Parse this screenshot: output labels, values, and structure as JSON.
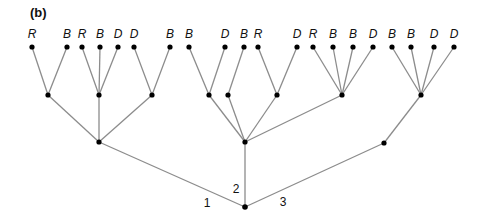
{
  "panel_label": "(b)",
  "root": {
    "id": "root",
    "x": 245,
    "y": 207
  },
  "branch_labels": [
    {
      "text": "1",
      "x": 207,
      "y": 207
    },
    {
      "text": "2",
      "x": 236,
      "y": 193
    },
    {
      "text": "3",
      "x": 283,
      "y": 206
    }
  ],
  "level1": [
    {
      "id": "n1",
      "x": 99,
      "y": 142
    },
    {
      "id": "n2",
      "x": 245,
      "y": 142
    },
    {
      "id": "n3",
      "x": 384,
      "y": 143
    }
  ],
  "level2": [
    {
      "id": "a1",
      "parent": "n1",
      "x": 48,
      "y": 95
    },
    {
      "id": "a2",
      "parent": "n1",
      "x": 99,
      "y": 95
    },
    {
      "id": "a3",
      "parent": "n1",
      "x": 152,
      "y": 95
    },
    {
      "id": "b1",
      "parent": "n2",
      "x": 209,
      "y": 95
    },
    {
      "id": "b2",
      "parent": "n2",
      "x": 228,
      "y": 95
    },
    {
      "id": "b3",
      "parent": "n2",
      "x": 277,
      "y": 95
    },
    {
      "id": "b4",
      "parent": "n2",
      "x": 342,
      "y": 95
    },
    {
      "id": "c1",
      "parent": "n3",
      "x": 421,
      "y": 95
    }
  ],
  "leaves": [
    {
      "parent": "a1",
      "label": "R",
      "x": 32,
      "y": 47
    },
    {
      "parent": "a1",
      "label": "B",
      "x": 67,
      "y": 47
    },
    {
      "parent": "a2",
      "label": "R",
      "x": 82,
      "y": 47
    },
    {
      "parent": "a2",
      "label": "B",
      "x": 100,
      "y": 47
    },
    {
      "parent": "a2",
      "label": "D",
      "x": 118,
      "y": 47
    },
    {
      "parent": "a3",
      "label": "D",
      "x": 134,
      "y": 47
    },
    {
      "parent": "a3",
      "label": "B",
      "x": 170,
      "y": 47
    },
    {
      "parent": "b1",
      "label": "B",
      "x": 189,
      "y": 47
    },
    {
      "parent": "b1",
      "label": "D",
      "x": 225,
      "y": 47
    },
    {
      "parent": "b2",
      "label": "B",
      "x": 244,
      "y": 47
    },
    {
      "parent": "b3",
      "label": "R",
      "x": 258,
      "y": 47
    },
    {
      "parent": "b3",
      "label": "D",
      "x": 297,
      "y": 47
    },
    {
      "parent": "b4",
      "label": "R",
      "x": 313,
      "y": 47
    },
    {
      "parent": "b4",
      "label": "B",
      "x": 333,
      "y": 47
    },
    {
      "parent": "b4",
      "label": "B",
      "x": 353,
      "y": 47
    },
    {
      "parent": "b4",
      "label": "D",
      "x": 373,
      "y": 47
    },
    {
      "parent": "c1",
      "label": "B",
      "x": 392,
      "y": 47
    },
    {
      "parent": "c1",
      "label": "B",
      "x": 411,
      "y": 47
    },
    {
      "parent": "c1",
      "label": "D",
      "x": 434,
      "y": 47
    },
    {
      "parent": "c1",
      "label": "D",
      "x": 454,
      "y": 47
    }
  ],
  "colors": {
    "edge": "#8c8c8c",
    "node": "#000000",
    "text": "#111111"
  }
}
